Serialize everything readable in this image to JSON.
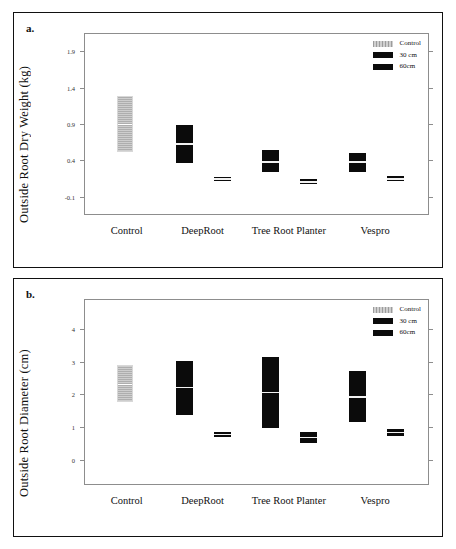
{
  "figure": {
    "panels": [
      {
        "id": "a",
        "panel_label": "a.",
        "ylabel": "Outside Root Dry Weight (kg)",
        "yticks": [
          "1.9",
          "1.4",
          "0.9",
          "0.4",
          "-0.1"
        ],
        "xlabels": [
          "Control",
          "DeepRoot",
          "Tree Root Planter",
          "Vespro"
        ],
        "legend": [
          {
            "label": "Control",
            "swatch": "gray"
          },
          {
            "label": "30 cm",
            "swatch": "black"
          },
          {
            "label": "60cm",
            "swatch": "black"
          }
        ]
      },
      {
        "id": "b",
        "panel_label": "b.",
        "ylabel": "Outside Root Diameter (cm)",
        "yticks": [
          "4",
          "3",
          "2",
          "1",
          "0"
        ],
        "xlabels": [
          "Control",
          "DeepRoot",
          "Tree Root Planter",
          "Vespro"
        ],
        "legend": [
          {
            "label": "Control",
            "swatch": "gray"
          },
          {
            "label": "30 cm",
            "swatch": "black"
          },
          {
            "label": "60cm",
            "swatch": "black"
          }
        ]
      }
    ]
  },
  "chart_data": [
    {
      "type": "bar",
      "title": "a.",
      "xlabel": "",
      "ylabel": "Outside Root Dry Weight (kg)",
      "ylim": [
        -0.35,
        2.15
      ],
      "yticks": [
        1.9,
        1.4,
        0.9,
        0.4,
        -0.1
      ],
      "grid": false,
      "legend_position": "top-right",
      "categories": [
        "Control",
        "DeepRoot",
        "Tree Root Planter",
        "Vespro"
      ],
      "series": [
        {
          "name": "Control",
          "color": "#b9b9b9",
          "boxes": [
            {
              "category": "Control",
              "low": 0.53,
              "median": 0.92,
              "high": 1.3
            },
            {
              "category": "DeepRoot",
              "low": null,
              "median": null,
              "high": null
            },
            {
              "category": "Tree Root Planter",
              "low": null,
              "median": null,
              "high": null
            },
            {
              "category": "Vespro",
              "low": null,
              "median": null,
              "high": null
            }
          ]
        },
        {
          "name": "30 cm",
          "color": "#0b0b0b",
          "boxes": [
            {
              "category": "Control",
              "low": null,
              "median": null,
              "high": null
            },
            {
              "category": "DeepRoot",
              "low": 0.38,
              "median": 0.64,
              "high": 0.9
            },
            {
              "category": "Tree Root Planter",
              "low": 0.25,
              "median": 0.39,
              "high": 0.56
            },
            {
              "category": "Vespro",
              "low": 0.26,
              "median": 0.39,
              "high": 0.52
            }
          ]
        },
        {
          "name": "60cm",
          "color": "#0b0b0b",
          "boxes": [
            {
              "category": "Control",
              "low": null,
              "median": null,
              "high": null
            },
            {
              "category": "DeepRoot",
              "low": 0.13,
              "median": 0.16,
              "high": 0.19
            },
            {
              "category": "Tree Root Planter",
              "low": 0.09,
              "median": 0.12,
              "high": 0.16
            },
            {
              "category": "Vespro",
              "low": 0.13,
              "median": 0.16,
              "high": 0.2
            }
          ]
        }
      ]
    },
    {
      "type": "bar",
      "title": "b.",
      "xlabel": "",
      "ylabel": "Outside Root Diameter (cm)",
      "ylim": [
        -0.75,
        4.9
      ],
      "yticks": [
        4,
        3,
        2,
        1,
        0
      ],
      "grid": false,
      "legend_position": "top-right",
      "categories": [
        "Control",
        "DeepRoot",
        "Tree Root Planter",
        "Vespro"
      ],
      "series": [
        {
          "name": "Control",
          "color": "#b9b9b9",
          "boxes": [
            {
              "category": "Control",
              "low": 1.8,
              "median": 2.36,
              "high": 2.93
            },
            {
              "category": "DeepRoot",
              "low": null,
              "median": null,
              "high": null
            },
            {
              "category": "Tree Root Planter",
              "low": null,
              "median": null,
              "high": null
            },
            {
              "category": "Vespro",
              "low": null,
              "median": null,
              "high": null
            }
          ]
        },
        {
          "name": "30 cm",
          "color": "#0b0b0b",
          "boxes": [
            {
              "category": "Control",
              "low": null,
              "median": null,
              "high": null
            },
            {
              "category": "DeepRoot",
              "low": 1.42,
              "median": 2.24,
              "high": 3.06
            },
            {
              "category": "Tree Root Planter",
              "low": 1.02,
              "median": 2.09,
              "high": 3.16
            },
            {
              "category": "Vespro",
              "low": 1.18,
              "median": 1.95,
              "high": 2.75
            }
          ]
        },
        {
          "name": "60cm",
          "color": "#0b0b0b",
          "boxes": [
            {
              "category": "Control",
              "low": null,
              "median": null,
              "high": null
            },
            {
              "category": "DeepRoot",
              "low": 0.73,
              "median": 0.82,
              "high": 0.9
            },
            {
              "category": "Tree Root Planter",
              "low": 0.56,
              "median": 0.72,
              "high": 0.9
            },
            {
              "category": "Vespro",
              "low": 0.78,
              "median": 0.88,
              "high": 0.99
            }
          ]
        }
      ]
    }
  ]
}
